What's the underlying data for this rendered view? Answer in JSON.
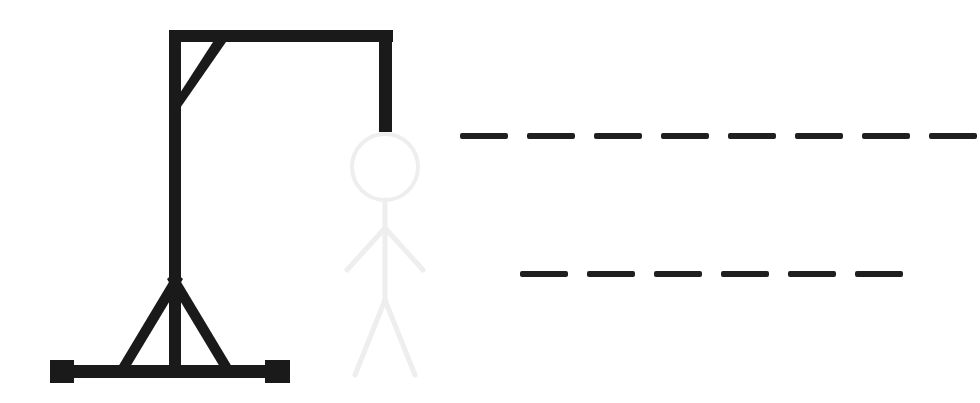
{
  "app": {
    "title": "Hangman",
    "background_color": "#ffffff"
  },
  "colors": {
    "ink": "#1a1a1a",
    "gallows": "#1a1a1a",
    "figure_unrevealed": "#eeeeee",
    "blank_dash": "#1f1f1f"
  },
  "gallows": {
    "name": "gallows",
    "state_label": "gallows-complete",
    "parts": [
      {
        "id": "base-beam",
        "label": "base-beam",
        "visible": true
      },
      {
        "id": "left-foot",
        "label": "left-foot-block",
        "visible": true
      },
      {
        "id": "right-foot",
        "label": "right-foot-block",
        "visible": true
      },
      {
        "id": "support-left",
        "label": "base-support-left-strut",
        "visible": true
      },
      {
        "id": "support-right",
        "label": "base-support-right-strut",
        "visible": true
      },
      {
        "id": "main-post",
        "label": "vertical-post",
        "visible": true
      },
      {
        "id": "top-beam",
        "label": "top-beam",
        "visible": true
      },
      {
        "id": "diagonal-brace",
        "label": "diagonal-brace",
        "visible": true
      },
      {
        "id": "rope",
        "label": "rope",
        "visible": true
      }
    ]
  },
  "figure": {
    "name": "hangman-figure",
    "revealed_color": "#1a1a1a",
    "placeholder_color": "#eeeeee",
    "wrong_guesses": 0,
    "parts": [
      {
        "id": "head",
        "label": "head",
        "drawn": false
      },
      {
        "id": "body",
        "label": "body",
        "drawn": false
      },
      {
        "id": "left-arm",
        "label": "left-arm",
        "drawn": false
      },
      {
        "id": "right-arm",
        "label": "right-arm",
        "drawn": false
      },
      {
        "id": "left-leg",
        "label": "left-leg",
        "drawn": false
      },
      {
        "id": "right-leg",
        "label": "right-leg",
        "drawn": false
      }
    ]
  },
  "puzzle": {
    "name": "word-blanks",
    "line_count": 2,
    "lines": [
      {
        "index": 0,
        "blank_count": 8,
        "letters": [
          "",
          "",
          "",
          "",
          "",
          "",
          "",
          ""
        ],
        "dash_y": 133,
        "dash_start_x": 460,
        "dash_width": 48,
        "dash_gap": 19
      },
      {
        "index": 1,
        "blank_count": 6,
        "letters": [
          "",
          "",
          "",
          "",
          "",
          ""
        ],
        "dash_y": 271,
        "dash_start_x": 520,
        "dash_width": 48,
        "dash_gap": 19
      }
    ]
  }
}
